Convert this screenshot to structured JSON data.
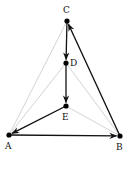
{
  "diagram": {
    "type": "directed-graph",
    "colors": {
      "arrow": "#111111",
      "light_edge": "#c8c8c8",
      "node": "#000000"
    },
    "nodes": [
      {
        "id": "C",
        "label": "C",
        "x": 67,
        "y": 21,
        "lx": 63,
        "ly": 13
      },
      {
        "id": "D",
        "label": "D",
        "x": 66,
        "y": 63,
        "lx": 70,
        "ly": 66
      },
      {
        "id": "E",
        "label": "E",
        "x": 66,
        "y": 106,
        "lx": 62,
        "ly": 120
      },
      {
        "id": "A",
        "label": "A",
        "x": 9,
        "y": 135,
        "lx": 5,
        "ly": 149
      },
      {
        "id": "B",
        "label": "B",
        "x": 120,
        "y": 136,
        "lx": 116,
        "ly": 150
      }
    ],
    "light_edges": [
      [
        "A",
        "C"
      ],
      [
        "A",
        "D"
      ],
      [
        "D",
        "B"
      ],
      [
        "E",
        "B"
      ],
      [
        "C",
        "B"
      ],
      [
        "A",
        "E"
      ]
    ],
    "arrows": [
      [
        "C",
        "D"
      ],
      [
        "D",
        "E"
      ],
      [
        "E",
        "A"
      ],
      [
        "A",
        "B"
      ],
      [
        "B",
        "C"
      ]
    ]
  }
}
